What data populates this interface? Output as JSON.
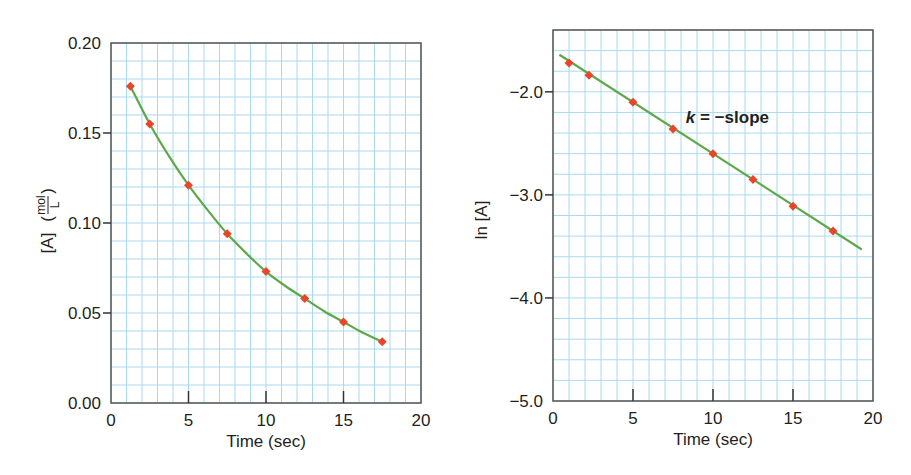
{
  "colors": {
    "grid": "#a9d9ef",
    "axis": "#555555",
    "fit_line": "#5fa84a",
    "marker": "#e8462a",
    "text": "#231f20"
  },
  "chart_data": [
    {
      "type": "scatter",
      "title": "",
      "xlabel": "Time (sec)",
      "ylabel": "[A] (mol/L)",
      "ylabel_main": "[A]",
      "ylabel_unit_num": "mol",
      "ylabel_unit_den": "L",
      "xlim": [
        0,
        20
      ],
      "ylim": [
        0.0,
        0.2
      ],
      "xticks": [
        0,
        5,
        10,
        15,
        20
      ],
      "xtick_labels": [
        "0",
        "5",
        "10",
        "15",
        "20"
      ],
      "yticks": [
        0.0,
        0.05,
        0.1,
        0.15,
        0.2
      ],
      "ytick_labels": [
        "0.00",
        "0.05",
        "0.10",
        "0.15",
        "0.20"
      ],
      "grid": true,
      "grid_x_step": 1,
      "grid_y_step": 0.01,
      "series": [
        {
          "name": "measured [A]",
          "marker": "diamond",
          "x": [
            1.25,
            2.5,
            5,
            7.5,
            10,
            12.5,
            15,
            17.5
          ],
          "y": [
            0.176,
            0.155,
            0.121,
            0.094,
            0.073,
            0.058,
            0.045,
            0.034
          ]
        },
        {
          "name": "exponential fit",
          "style": "curve",
          "x": [
            1.25,
            2.5,
            3.75,
            5,
            6.25,
            7.5,
            8.75,
            10,
            11.25,
            12.5,
            13.75,
            15,
            16.25,
            17.5
          ],
          "y": [
            0.176,
            0.155,
            0.137,
            0.121,
            0.107,
            0.094,
            0.083,
            0.073,
            0.065,
            0.058,
            0.051,
            0.045,
            0.039,
            0.034
          ]
        }
      ],
      "annotations": []
    },
    {
      "type": "scatter",
      "title": "",
      "xlabel": "Time (sec)",
      "ylabel": "ln [A]",
      "xlim": [
        0,
        20
      ],
      "ylim": [
        -5.0,
        -1.4
      ],
      "xticks": [
        0,
        5,
        10,
        15,
        20
      ],
      "xtick_labels": [
        "0",
        "5",
        "10",
        "15",
        "20"
      ],
      "yticks": [
        -5.0,
        -4.0,
        -3.0,
        -2.0
      ],
      "ytick_labels": [
        "−5.0",
        "−4.0",
        "−3.0",
        "−2.0"
      ],
      "grid": true,
      "grid_x_step": 1,
      "grid_y_step": 0.2,
      "series": [
        {
          "name": "measured ln [A]",
          "marker": "diamond",
          "x": [
            1.0,
            2.25,
            5,
            7.5,
            10,
            12.5,
            15,
            17.5
          ],
          "y": [
            -1.72,
            -1.84,
            -2.1,
            -2.36,
            -2.6,
            -2.85,
            -3.11,
            -3.35
          ]
        },
        {
          "name": "linear fit",
          "style": "line",
          "x": [
            0.4,
            19.3
          ],
          "y": [
            -1.64,
            -3.53
          ]
        }
      ],
      "annotations": [
        {
          "text_italic": "k",
          "text_rest": " = −slope",
          "x": 8.3,
          "y": -2.3
        }
      ]
    }
  ],
  "layout": {
    "charts": [
      {
        "plot_left": 111,
        "plot_top": 43,
        "plot_right": 421,
        "plot_bottom": 403
      },
      {
        "plot_left": 553,
        "plot_top": 30,
        "plot_right": 873,
        "plot_bottom": 401
      }
    ]
  }
}
